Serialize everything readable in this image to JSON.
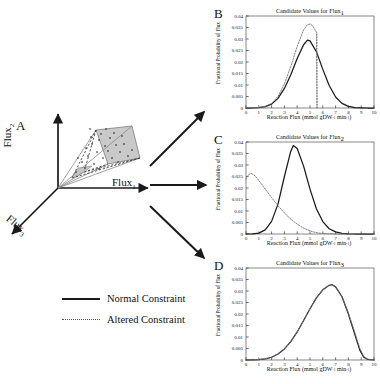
{
  "figure": {
    "panelA": {
      "letter": "A",
      "axes": [
        {
          "name": "flux1-axis-label",
          "text": "Flux",
          "subscript": "1"
        },
        {
          "name": "flux2-axis-label",
          "text": "Flux",
          "subscript": "2"
        },
        {
          "name": "flux3-axis-label",
          "text": "Flux",
          "subscript": "3"
        }
      ]
    },
    "legend": {
      "items": [
        {
          "style": "solid",
          "label": "Normal Constraint"
        },
        {
          "style": "dotted",
          "label": "Altered Constraint"
        }
      ]
    },
    "axis_label_x": "Reaction Flux (mmol gDW",
    "axis_label_x_sup1": "-1",
    "axis_label_x_mid": " min",
    "axis_label_x_sup2": "-1",
    "axis_label_x_end": ")",
    "axis_label_y": "Fractional Probability of Flux"
  },
  "chart_data": [
    {
      "panel": "B",
      "type": "line",
      "title": "Candidate Values for Flux",
      "title_subscript": "1",
      "xlabel": "Reaction Flux (mmol gDW-1 min-1)",
      "ylabel": "Fractional Probability of Flux",
      "xlim": [
        0,
        10
      ],
      "ylim": [
        0,
        0.04
      ],
      "xticks": [
        0,
        1,
        2,
        3,
        4,
        5,
        6,
        7,
        8,
        9,
        10
      ],
      "yticks": [
        0,
        0.005,
        0.01,
        0.015,
        0.02,
        0.025,
        0.03,
        0.035,
        0.04
      ],
      "ytick_labels": [
        "0",
        "0.005",
        "0.01",
        "0.015",
        "0.02",
        "0.025",
        "0.03",
        "0.035",
        "0.04"
      ],
      "grid": false,
      "legend_position": "external",
      "series": [
        {
          "name": "Normal Constraint",
          "style": "solid",
          "peak_x": 4.8,
          "peak_y": 0.0295,
          "x": [
            0,
            0.5,
            1,
            1.5,
            2,
            2.5,
            3,
            3.5,
            4,
            4.5,
            4.8,
            5,
            5.5,
            6,
            6.5,
            7,
            7.5,
            8,
            8.5,
            9,
            9.5,
            10
          ],
          "y": [
            0,
            0,
            0.0002,
            0.0006,
            0.0017,
            0.0042,
            0.0085,
            0.0145,
            0.0215,
            0.0275,
            0.0295,
            0.0292,
            0.0245,
            0.0168,
            0.0098,
            0.0048,
            0.002,
            0.0007,
            0.0002,
            0.0001,
            0,
            0
          ]
        },
        {
          "name": "Altered Constraint",
          "style": "dotted",
          "peak_x": 5.0,
          "peak_y": 0.0365,
          "truncation_x": 5.55,
          "x": [
            0,
            0.5,
            1,
            1.5,
            2,
            2.5,
            3,
            3.5,
            4,
            4.5,
            4.8,
            5,
            5.2,
            5.5,
            5.55
          ],
          "y": [
            0,
            0,
            0.0002,
            0.0007,
            0.002,
            0.005,
            0.0105,
            0.018,
            0.0268,
            0.034,
            0.0362,
            0.0365,
            0.0358,
            0.033,
            0
          ]
        }
      ]
    },
    {
      "panel": "C",
      "type": "line",
      "title": "Candidate Values for Flux",
      "title_subscript": "2",
      "xlabel": "Reaction Flux (mmol gDW-1 min-1)",
      "ylabel": "Fractional Probability of Flux",
      "xlim": [
        0,
        10
      ],
      "ylim": [
        0,
        0.04
      ],
      "xticks": [
        0,
        1,
        2,
        3,
        4,
        5,
        6,
        7,
        8,
        9,
        10
      ],
      "yticks": [
        0,
        0.005,
        0.01,
        0.015,
        0.02,
        0.025,
        0.03,
        0.035,
        0.04
      ],
      "ytick_labels": [
        "0",
        "0.005",
        "0.01",
        "0.015",
        "0.02",
        "0.025",
        "0.03",
        "0.035",
        "0.04"
      ],
      "grid": false,
      "legend_position": "external",
      "series": [
        {
          "name": "Normal Constraint",
          "style": "solid",
          "peak_x": 3.7,
          "peak_y": 0.0385,
          "x": [
            0,
            0.5,
            1,
            1.5,
            2,
            2.5,
            3,
            3.5,
            3.7,
            4,
            4.5,
            5,
            5.5,
            6,
            6.5,
            7,
            7.5,
            8,
            8.5,
            9,
            9.5,
            10
          ],
          "y": [
            0,
            0.0001,
            0.0004,
            0.0018,
            0.0055,
            0.013,
            0.025,
            0.036,
            0.0385,
            0.0372,
            0.0295,
            0.0195,
            0.011,
            0.0054,
            0.0023,
            0.0009,
            0.0003,
            0.0001,
            0,
            0,
            0,
            0
          ]
        },
        {
          "name": "Altered Constraint",
          "style": "dotted",
          "peak_x": 0.4,
          "peak_y": 0.0263,
          "x": [
            0,
            0.2,
            0.4,
            0.6,
            0.9,
            1.2,
            1.6,
            2,
            2.4,
            2.8,
            3.2,
            3.6,
            4,
            4.4,
            4.8,
            5.2,
            5.6,
            6,
            6.5,
            7,
            8,
            9,
            10
          ],
          "y": [
            0.0238,
            0.0258,
            0.0263,
            0.0258,
            0.024,
            0.0218,
            0.0188,
            0.0158,
            0.013,
            0.0104,
            0.008,
            0.006,
            0.0043,
            0.0029,
            0.0018,
            0.001,
            0.0005,
            0.0002,
            0.0001,
            0,
            0,
            0,
            0
          ]
        }
      ]
    },
    {
      "panel": "D",
      "type": "line",
      "title": "Candidate Values for Flux",
      "title_subscript": "3",
      "xlabel": "Reaction Flux (mmol gDW-1 min-1)",
      "ylabel": "Fractional Probability of Flux",
      "xlim": [
        0,
        10
      ],
      "ylim": [
        0,
        0.04
      ],
      "xticks": [
        0,
        1,
        2,
        3,
        4,
        5,
        6,
        7,
        8,
        9,
        10
      ],
      "yticks": [
        0,
        0.005,
        0.01,
        0.015,
        0.02,
        0.025,
        0.03,
        0.035,
        0.04
      ],
      "ytick_labels": [
        "0",
        "0.005",
        "0.01",
        "0.015",
        "0.02",
        "0.025",
        "0.03",
        "0.035",
        "0.04"
      ],
      "grid": false,
      "legend_position": "external",
      "series": [
        {
          "name": "Normal Constraint",
          "style": "solid",
          "peak_x": 6.7,
          "peak_y": 0.0328,
          "x": [
            0,
            0.5,
            1,
            1.5,
            2,
            2.5,
            3,
            3.5,
            4,
            4.5,
            5,
            5.5,
            6,
            6.5,
            6.7,
            7,
            7.5,
            8,
            8.5,
            8.9,
            9.2,
            9.5,
            10
          ],
          "y": [
            0,
            0.0001,
            0.0002,
            0.0005,
            0.0012,
            0.0026,
            0.0048,
            0.008,
            0.0122,
            0.0172,
            0.0223,
            0.027,
            0.0305,
            0.0325,
            0.0328,
            0.0318,
            0.0275,
            0.02,
            0.0112,
            0.0042,
            0.0012,
            0.0003,
            0
          ]
        },
        {
          "name": "Altered Constraint",
          "style": "dotted",
          "peak_x": 6.7,
          "peak_y": 0.0328,
          "x": [
            0,
            0.5,
            1,
            1.5,
            2,
            2.5,
            3,
            3.5,
            4,
            4.5,
            5,
            5.5,
            6,
            6.5,
            6.7,
            7,
            7.5,
            8,
            8.5,
            8.9,
            9.2,
            9.5,
            10
          ],
          "y": [
            0,
            0.0001,
            0.0002,
            0.0005,
            0.0012,
            0.0026,
            0.0048,
            0.008,
            0.0122,
            0.0172,
            0.0223,
            0.027,
            0.0305,
            0.0325,
            0.0328,
            0.0318,
            0.0276,
            0.0204,
            0.012,
            0.005,
            0.0016,
            0.0004,
            0
          ]
        }
      ]
    }
  ]
}
